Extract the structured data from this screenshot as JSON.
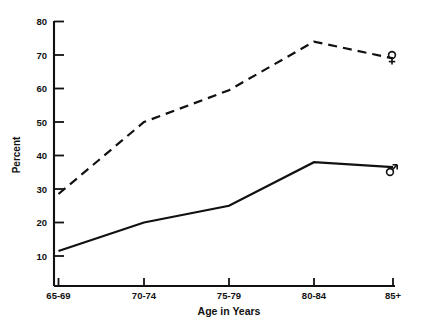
{
  "chart_data": {
    "type": "line",
    "title": "",
    "xlabel": "Age in Years",
    "ylabel": "Percent",
    "categories": [
      "65-69",
      "70-74",
      "75-79",
      "80-84",
      "85+"
    ],
    "ylim": [
      0,
      80
    ],
    "yticks": [
      10,
      20,
      30,
      40,
      50,
      60,
      70,
      80
    ],
    "ytick_labels": [
      "10",
      "20",
      "30",
      "40",
      "50",
      "60",
      "70",
      "80"
    ],
    "grid": false,
    "legend_position": "line-end-markers",
    "series": [
      {
        "name": "Female",
        "marker_symbol": "♀",
        "style": "dashed",
        "values": [
          28.5,
          50,
          59.5,
          74,
          69
        ]
      },
      {
        "name": "Male",
        "marker_symbol": "♂",
        "style": "solid",
        "values": [
          11.5,
          20,
          25,
          38,
          36.5
        ]
      }
    ],
    "colors": {
      "ink": "#111111",
      "background": "#ffffff"
    }
  },
  "axis": {
    "x_tick_labels": [
      "65-69",
      "70-74",
      "75-79",
      "80-84",
      "85+"
    ],
    "y_tick_labels": [
      "80",
      "70",
      "60",
      "50",
      "40",
      "30",
      "20",
      "10"
    ],
    "x_axis_title": "Age in Years",
    "y_axis_title": "Percent"
  },
  "markers": {
    "female_label": "♀",
    "male_label": "♂"
  }
}
